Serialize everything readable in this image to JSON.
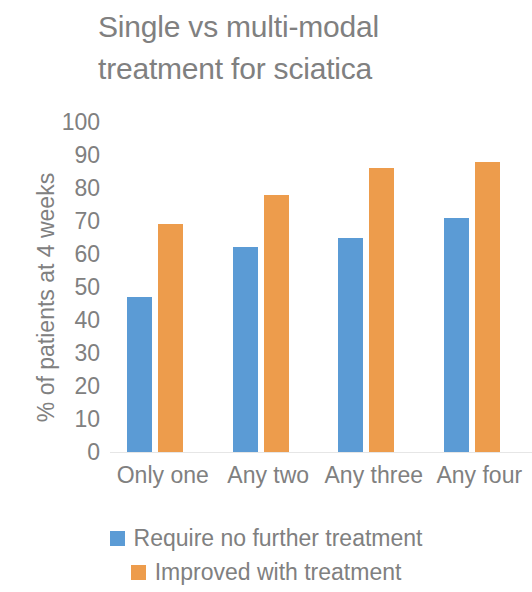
{
  "chart_data": {
    "type": "bar",
    "title": "Single vs multi-modal treatment for sciatica",
    "title_line1": "Single vs multi-modal",
    "title_line2": "treatment for sciatica",
    "xlabel": "",
    "ylabel": "% of patients at 4 weeks",
    "categories": [
      "Only one",
      "Any two",
      "Any three",
      "Any four"
    ],
    "series": [
      {
        "name": "Require no further treatment",
        "color": "#5B9BD5",
        "values": [
          47,
          62,
          65,
          71
        ]
      },
      {
        "name": "Improved with treatment",
        "color": "#ED9C4C",
        "values": [
          69,
          78,
          86,
          88
        ]
      }
    ],
    "ylim": [
      0,
      100
    ],
    "y_ticks": [
      100,
      90,
      80,
      70,
      60,
      50,
      40,
      30,
      20,
      10,
      0
    ],
    "grid": false,
    "legend_position": "bottom",
    "text_color": "#808080",
    "background": "#ffffff"
  }
}
